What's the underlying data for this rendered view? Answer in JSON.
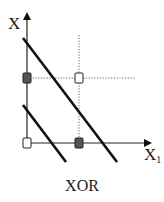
{
  "figure": {
    "title": "XOR",
    "axes": {
      "y_label": "X",
      "x_label": "X",
      "x_label_subscript": "1"
    },
    "colors": {
      "line": "#111111",
      "dotted": "#555555",
      "filled_point": "#555555",
      "open_point": "#ffffff"
    },
    "points": [
      {
        "name": "origin",
        "x": 0,
        "y": 0,
        "class": "open"
      },
      {
        "name": "x1-only",
        "x": 1,
        "y": 0,
        "class": "filled"
      },
      {
        "name": "x2-only",
        "x": 0,
        "y": 1,
        "class": "filled"
      },
      {
        "name": "both",
        "x": 1,
        "y": 1,
        "class": "open"
      }
    ],
    "decision_lines": [
      {
        "name": "upper-boundary",
        "description": "long diagonal line"
      },
      {
        "name": "lower-boundary",
        "description": "short diagonal line"
      }
    ]
  }
}
